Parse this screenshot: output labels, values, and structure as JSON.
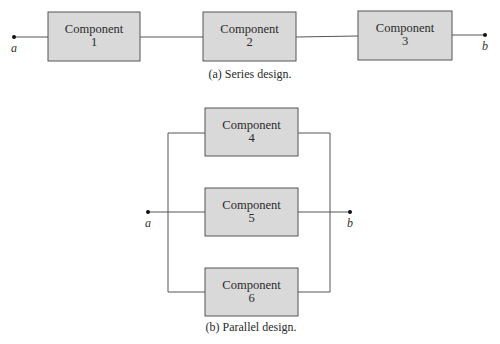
{
  "series": {
    "caption": "(a) Series design.",
    "node_a": "a",
    "node_b": "b",
    "components": [
      {
        "label": "Component",
        "number": "1"
      },
      {
        "label": "Component",
        "number": "2"
      },
      {
        "label": "Component",
        "number": "3"
      }
    ]
  },
  "parallel": {
    "caption": "(b) Parallel design.",
    "node_a": "a",
    "node_b": "b",
    "components": [
      {
        "label": "Component",
        "number": "4"
      },
      {
        "label": "Component",
        "number": "5"
      },
      {
        "label": "Component",
        "number": "6"
      }
    ]
  },
  "colors": {
    "box_fill": "#d9d9d9",
    "box_stroke": "#555555",
    "wire": "#555555"
  }
}
